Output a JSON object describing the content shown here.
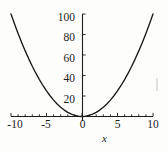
{
  "chart_data": {
    "type": "line",
    "title": "",
    "subtitle": "",
    "xlabel": "x",
    "ylabel": "",
    "function": "y = x^2",
    "xlim": [
      -10,
      10
    ],
    "ylim": [
      0,
      100
    ],
    "grid": false,
    "legend": null,
    "x_ticks": [
      -10,
      -5,
      0,
      5,
      10
    ],
    "x_tick_labels": [
      "-10",
      "-5",
      "0",
      "5",
      "10"
    ],
    "y_ticks": [
      20,
      40,
      60,
      80,
      100
    ],
    "y_tick_labels": [
      "20",
      "40",
      "60",
      "80",
      "100"
    ],
    "x_minor_tick_step": 1,
    "series": [
      {
        "name": "y = x^2",
        "color": "#1a1a1a",
        "x": [
          -10,
          -9.5,
          -9,
          -8.5,
          -8,
          -7.5,
          -7,
          -6.5,
          -6,
          -5.5,
          -5,
          -4.5,
          -4,
          -3.5,
          -3,
          -2.5,
          -2,
          -1.5,
          -1,
          -0.5,
          0,
          0.5,
          1,
          1.5,
          2,
          2.5,
          3,
          3.5,
          4,
          4.5,
          5,
          5.5,
          6,
          6.5,
          7,
          7.5,
          8,
          8.5,
          9,
          9.5,
          10
        ],
        "values": [
          100,
          90.25,
          81,
          72.25,
          64,
          56.25,
          49,
          42.25,
          36,
          30.25,
          25,
          20.25,
          16,
          12.25,
          9,
          6.25,
          4,
          2.25,
          1,
          0.25,
          0,
          0.25,
          1,
          2.25,
          4,
          6.25,
          9,
          12.25,
          16,
          20.25,
          25,
          30.25,
          36,
          42.25,
          49,
          56.25,
          64,
          72.25,
          81,
          90.25,
          100
        ]
      }
    ],
    "annotations": [],
    "colors": {
      "background": "#fdfdfc",
      "axis": "#1c1c1c",
      "curve": "#1a1a1a",
      "text": "#1c1c1c",
      "artifact": "#c9c9c9"
    }
  },
  "axes": {
    "x_axis_label": "x",
    "x_tick_labels": [
      "-10",
      "-5",
      "0",
      "5",
      "10"
    ],
    "y_tick_labels": [
      "20",
      "40",
      "60",
      "80",
      "100"
    ]
  }
}
